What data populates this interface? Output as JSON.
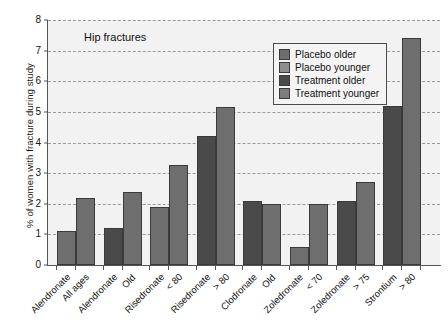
{
  "chart_data": {
    "type": "bar",
    "title": "",
    "annotation": "Hip fractures",
    "xlabel": "",
    "ylabel": "% of women with fracture during study",
    "ylim": [
      0,
      8
    ],
    "yticks": [
      0,
      1,
      2,
      3,
      4,
      5,
      6,
      7,
      8
    ],
    "grid": true,
    "legend_position": "top-right",
    "legend": [
      {
        "name": "Placebo older",
        "color": "#6e6e6e"
      },
      {
        "name": "Placebo younger",
        "color": "#8e8e8e"
      },
      {
        "name": "Treatment older",
        "color": "#4a4a4a"
      },
      {
        "name": "Treatment younger",
        "color": "#7d7d7d"
      }
    ],
    "categories": [
      {
        "drug": "Alendronate",
        "group": "All ages"
      },
      {
        "drug": "Alendronate",
        "group": "Old"
      },
      {
        "drug": "Risedronate",
        "group": "< 80"
      },
      {
        "drug": "Risedronate",
        "group": "> 80"
      },
      {
        "drug": "Clodronate",
        "group": "Old"
      },
      {
        "drug": "Zoledronate",
        "group": "< 70"
      },
      {
        "drug": "Zoledronate",
        "group": "> 75"
      },
      {
        "drug": "Strontium",
        "group": "> 80"
      }
    ],
    "bars": [
      {
        "label": "Alendronate All ages placebo",
        "value": 1.1,
        "series": "placebo",
        "group_index": 0
      },
      {
        "label": "Alendronate All ages treatment",
        "value": 2.2,
        "series": "treatment",
        "group_index": 0
      },
      {
        "label": "Alendronate Old placebo",
        "value": 1.2,
        "series": "placebo-dark",
        "group_index": 1
      },
      {
        "label": "Alendronate Old treatment",
        "value": 2.4,
        "series": "treatment",
        "group_index": 1
      },
      {
        "label": "Risedronate < 80 placebo",
        "value": 1.9,
        "series": "placebo",
        "group_index": 2
      },
      {
        "label": "Risedronate < 80 treatment",
        "value": 3.25,
        "series": "treatment",
        "group_index": 2
      },
      {
        "label": "Risedronate > 80 placebo",
        "value": 4.2,
        "series": "placebo-dark",
        "group_index": 3
      },
      {
        "label": "Risedronate > 80 treatment",
        "value": 5.15,
        "series": "treatment",
        "group_index": 3
      },
      {
        "label": "Clodronate Old placebo",
        "value": 2.1,
        "series": "placebo-dark",
        "group_index": 4
      },
      {
        "label": "Clodronate Old treatment",
        "value": 2.0,
        "series": "treatment",
        "group_index": 4
      },
      {
        "label": "Zoledronate < 70 placebo",
        "value": 0.6,
        "series": "placebo",
        "group_index": 5
      },
      {
        "label": "Zoledronate < 70 treatment",
        "value": 2.0,
        "series": "treatment",
        "group_index": 5
      },
      {
        "label": "Zoledronate > 75 placebo",
        "value": 2.1,
        "series": "placebo-dark",
        "group_index": 6
      },
      {
        "label": "Zoledronate > 75 treatment",
        "value": 2.7,
        "series": "treatment",
        "group_index": 6
      },
      {
        "label": "Strontium > 80 placebo",
        "value": 5.2,
        "series": "placebo-dark",
        "group_index": 7
      },
      {
        "label": "Strontium > 80 treatment",
        "value": 7.4,
        "series": "treatment",
        "group_index": 7
      }
    ]
  },
  "colors": {
    "plot_background": "#f2f2f2",
    "axis": "#555555",
    "grid": "#9a9a9a",
    "bar_light": "#8e8e8e",
    "bar_medium": "#6e6e6e",
    "bar_dark": "#4a4a4a"
  }
}
